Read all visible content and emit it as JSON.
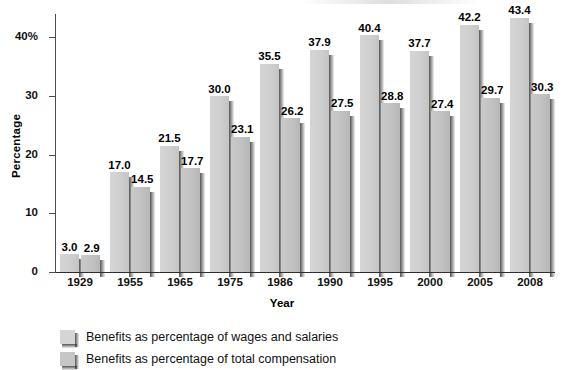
{
  "chart_data": {
    "type": "bar",
    "title": "",
    "xlabel": "Year",
    "ylabel": "Percentage",
    "ylim": [
      0,
      44
    ],
    "yticks": [
      0,
      10,
      20,
      30,
      40
    ],
    "ytick_labels": [
      "0",
      "10",
      "20",
      "30",
      "40%"
    ],
    "grid": false,
    "legend_position": "bottom-left",
    "categories": [
      "1929",
      "1955",
      "1965",
      "1975",
      "1986",
      "1990",
      "1995",
      "2000",
      "2005",
      "2008"
    ],
    "series": [
      {
        "name": "Benefits as percentage of wages and salaries",
        "color": "#d2d2d2",
        "values": [
          3.0,
          17.0,
          21.5,
          30.0,
          35.5,
          37.9,
          40.4,
          37.7,
          42.2,
          43.4
        ],
        "labels": [
          "3.0",
          "17.0",
          "21.5",
          "30.0",
          "35.5",
          "37.9",
          "40.4",
          "37.7",
          "42.2",
          "43.4"
        ]
      },
      {
        "name": "Benefits as percentage of total compensation",
        "color": "#c3c3c3",
        "values": [
          2.9,
          14.5,
          17.7,
          23.1,
          26.2,
          27.5,
          28.8,
          27.4,
          29.7,
          30.3
        ],
        "labels": [
          "2.9",
          "14.5",
          "17.7",
          "23.1",
          "26.2",
          "27.5",
          "28.8",
          "27.4",
          "29.7",
          "30.3"
        ]
      }
    ]
  },
  "axes": {
    "y_title": "Percentage",
    "x_title": "Year"
  },
  "legend": {
    "items": [
      {
        "label": "Benefits as percentage of wages and salaries",
        "swatch": "series-1-swatch"
      },
      {
        "label": "Benefits as percentage of total compensation",
        "swatch": "series-2-swatch"
      }
    ]
  }
}
